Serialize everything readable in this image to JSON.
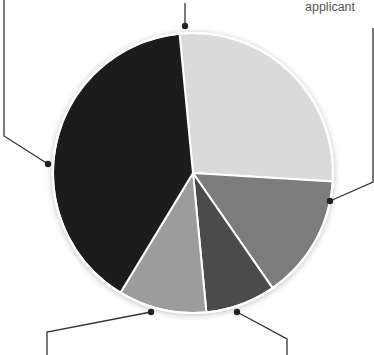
{
  "chart_data": {
    "type": "pie",
    "title": "",
    "center": [
      193,
      173
    ],
    "radius": 140,
    "start_angle_deg": -5.5,
    "slices": [
      {
        "label": "applicant",
        "value": 27.5,
        "color": "#dadada",
        "leader": "right"
      },
      {
        "label": "",
        "value": 14.4,
        "color": "#7b7b7b",
        "leader": "right-middle"
      },
      {
        "label": "",
        "value": 8.1,
        "color": "#4b4b4b",
        "leader": "bottom-right"
      },
      {
        "label": "",
        "value": 10.2,
        "color": "#9c9c9c",
        "leader": "bottom-left"
      },
      {
        "label": "",
        "value": 39.8,
        "color": "#1f1f1f",
        "leader": "left"
      }
    ],
    "legend": "none",
    "grid": false
  },
  "labels": {
    "applicant": "applicant"
  },
  "leaders": [
    {
      "name": "leader-top",
      "points": [
        [
          185,
          3
        ],
        [
          185,
          26
        ]
      ],
      "dot": [
        185,
        26
      ]
    },
    {
      "name": "leader-right",
      "points": [
        [
          373,
          28
        ],
        [
          373,
          182
        ],
        [
          330,
          201
        ]
      ],
      "dot": [
        330,
        201
      ]
    },
    {
      "name": "leader-left",
      "points": [
        [
          4,
          0
        ],
        [
          4,
          136
        ],
        [
          48,
          164
        ]
      ],
      "dot": [
        48,
        164
      ]
    },
    {
      "name": "leader-bottom-left",
      "points": [
        [
          151,
          312
        ],
        [
          47,
          332
        ],
        [
          47,
          355
        ]
      ],
      "dot": [
        151,
        312
      ]
    },
    {
      "name": "leader-bottom-right",
      "points": [
        [
          237,
          312
        ],
        [
          287,
          339
        ],
        [
          287,
          355
        ]
      ],
      "dot": [
        237,
        312
      ]
    }
  ],
  "colors": {
    "line": "#333333",
    "slice_border": "#ffffff",
    "label": "#555555"
  }
}
